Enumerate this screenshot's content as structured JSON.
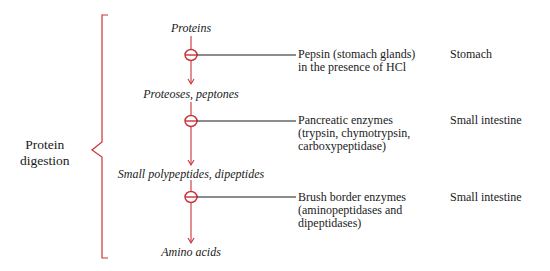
{
  "bracket_label": [
    "Protein",
    "digestion"
  ],
  "colors": {
    "accent": "#c8323a",
    "line": "#1a1a1a"
  },
  "substrates": [
    "Proteins",
    "Proteoses, peptones",
    "Small polypeptides, dipeptides",
    "Amino acids"
  ],
  "steps": [
    {
      "enzyme_lines": [
        "Pepsin (stomach glands)",
        "in the presence of HCl"
      ],
      "site": "Stomach"
    },
    {
      "enzyme_lines": [
        "Pancreatic enzymes",
        "(trypsin, chymotrypsin,",
        "carboxypeptidase)"
      ],
      "site": "Small intestine"
    },
    {
      "enzyme_lines": [
        "Brush border enzymes",
        "(aminopeptidases and",
        "dipeptidases)"
      ],
      "site": "Small intestine"
    }
  ]
}
